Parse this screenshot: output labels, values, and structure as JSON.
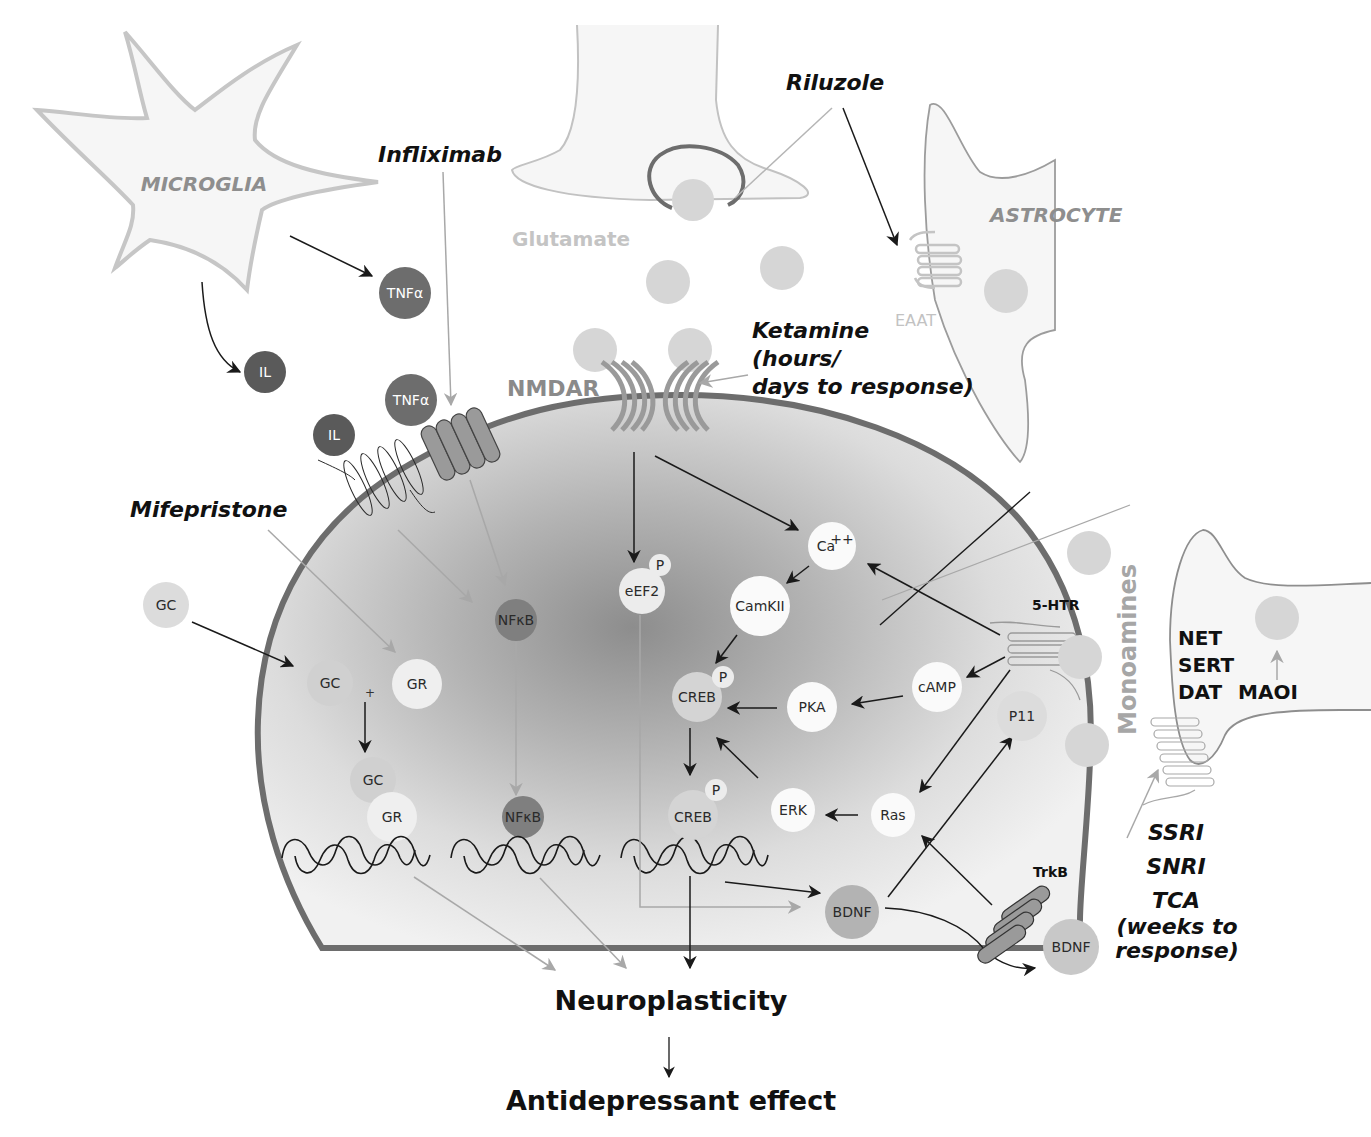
{
  "cells": {
    "microglia": "MICROGLIA",
    "astrocyte": "ASTROCYTE",
    "presynaptic_glutamate_neuron": "",
    "postsynaptic_neuron": "",
    "monoamine_neuron": ""
  },
  "labels": {
    "glutamate": "Glutamate",
    "nmdar": "NMDAR",
    "eaat": "EAAT",
    "ht5r": "5-HTR",
    "trkb": "TrkB",
    "monoamines": "Monoamines",
    "transporters": [
      "NET",
      "SERT",
      "DAT"
    ],
    "maoi": "MAOI",
    "plus_sign": "+"
  },
  "drugs": {
    "infliximab": "Infliximab",
    "riluzole": "Riluzole",
    "mifepristone": "Mifepristone",
    "ketamine": [
      "Ketamine",
      "(hours/",
      "days to response)"
    ],
    "monoaminergic": [
      "SSRI",
      "SNRI",
      "TCA"
    ],
    "monoaminergic_note": [
      "(weeks to",
      "response)"
    ]
  },
  "molecules": {
    "tnfa_1": "TNFα",
    "tnfa_2": "TNFα",
    "il_1": "IL",
    "il_2": "IL",
    "gc_outside": "GC",
    "gc_inside": "GC",
    "gr": "GR",
    "gc_bound": "GC",
    "gr_bound": "GR",
    "nfkb_1": "NFκB",
    "nfkb_2": "NFκB",
    "eef2": "eEF2",
    "eef2_p": "P",
    "ca": "Ca",
    "ca_sup": "++",
    "camkii": "CamKII",
    "creb_1": "CREB",
    "creb_1_p": "P",
    "creb_2": "CREB",
    "creb_2_p": "P",
    "pka": "PKA",
    "camp": "cAMP",
    "erk": "ERK",
    "ras": "Ras",
    "p11": "P11",
    "bdnf_inside": "BDNF",
    "bdnf_outside": "BDNF"
  },
  "outcomes": {
    "neuroplasticity": "Neuroplasticity",
    "antidepressant_effect": "Antidepressant effect"
  },
  "colors": {
    "cell_fill": "#f3f3f3",
    "membrane_dark": "#6f6f6f",
    "light_outline": "#bdbdbd",
    "molecule_dark": "#6d6d6d",
    "molecule_mid": "#8b8b8b",
    "molecule_light": "#d4d4d4",
    "molecule_white": "#f8f8f8",
    "text_dark": "#111111",
    "text_gray": "#8e8e8e"
  }
}
